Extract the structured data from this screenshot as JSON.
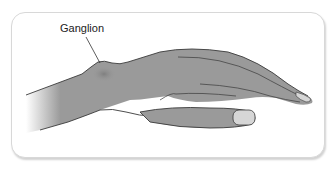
{
  "figure": {
    "annotation_label": "Ganglion",
    "colors": {
      "skin": "#9a9a9a",
      "skin_dark": "#7d7d7d",
      "outline": "#3a3a3a",
      "nail": "#d6d6d6",
      "frame_border": "#d8d8d8",
      "background": "#ffffff"
    }
  }
}
